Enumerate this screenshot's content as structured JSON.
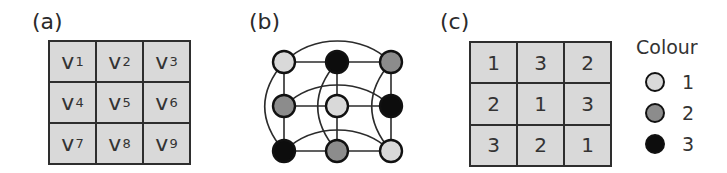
{
  "panels": {
    "a": {
      "label": "(a)",
      "cells": [
        {
          "sym": "v",
          "sub": "1"
        },
        {
          "sym": "v",
          "sub": "2"
        },
        {
          "sym": "v",
          "sub": "3"
        },
        {
          "sym": "v",
          "sub": "4"
        },
        {
          "sym": "v",
          "sub": "5"
        },
        {
          "sym": "v",
          "sub": "6"
        },
        {
          "sym": "v",
          "sub": "7"
        },
        {
          "sym": "v",
          "sub": "8"
        },
        {
          "sym": "v",
          "sub": "9"
        }
      ]
    },
    "b": {
      "label": "(b)",
      "nodes": [
        {
          "id": "v1",
          "row": 0,
          "col": 0,
          "colour": 1
        },
        {
          "id": "v2",
          "row": 0,
          "col": 1,
          "colour": 3
        },
        {
          "id": "v3",
          "row": 0,
          "col": 2,
          "colour": 2
        },
        {
          "id": "v4",
          "row": 1,
          "col": 0,
          "colour": 2
        },
        {
          "id": "v5",
          "row": 1,
          "col": 1,
          "colour": 1
        },
        {
          "id": "v6",
          "row": 1,
          "col": 2,
          "colour": 3
        },
        {
          "id": "v7",
          "row": 2,
          "col": 0,
          "colour": 3
        },
        {
          "id": "v8",
          "row": 2,
          "col": 1,
          "colour": 2
        },
        {
          "id": "v9",
          "row": 2,
          "col": 2,
          "colour": 1
        }
      ],
      "edges_straight": [
        [
          "v1",
          "v2"
        ],
        [
          "v2",
          "v3"
        ],
        [
          "v4",
          "v5"
        ],
        [
          "v5",
          "v6"
        ],
        [
          "v7",
          "v8"
        ],
        [
          "v8",
          "v9"
        ],
        [
          "v1",
          "v4"
        ],
        [
          "v4",
          "v7"
        ],
        [
          "v2",
          "v5"
        ],
        [
          "v5",
          "v8"
        ],
        [
          "v3",
          "v6"
        ],
        [
          "v6",
          "v9"
        ]
      ],
      "edges_curved": [
        [
          "v1",
          "v3"
        ],
        [
          "v4",
          "v6"
        ],
        [
          "v7",
          "v9"
        ],
        [
          "v1",
          "v7"
        ],
        [
          "v2",
          "v8"
        ],
        [
          "v3",
          "v9"
        ]
      ]
    },
    "c": {
      "label": "(c)",
      "cells": [
        "1",
        "3",
        "2",
        "2",
        "1",
        "3",
        "3",
        "2",
        "1"
      ]
    }
  },
  "legend": {
    "title": "Colour",
    "items": [
      {
        "label": "1",
        "color": "#d9d9d9"
      },
      {
        "label": "2",
        "color": "#8c8c8c"
      },
      {
        "label": "3",
        "color": "#0d0d0d"
      }
    ]
  },
  "colours": {
    "1": "#d9d9d9",
    "2": "#8c8c8c",
    "3": "#0d0d0d"
  }
}
